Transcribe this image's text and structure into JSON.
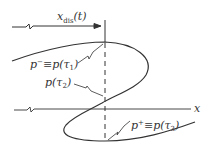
{
  "diagram": {
    "distance_label": {
      "main": "x",
      "sub": "dis",
      "arg": "(t)"
    },
    "axis_label": "x",
    "points": [
      {
        "id": "p_minus",
        "text": "p⁻ ≡ p(τ₁)",
        "main": "p",
        "sup": "−",
        "eq": "≡p(τ",
        "tau_sub": "1",
        "close": ")"
      },
      {
        "id": "p_tau2",
        "text": "p(τ₂)",
        "main": "p(τ",
        "tau_sub": "2",
        "close": ")"
      },
      {
        "id": "p_plus",
        "text": "p⁺ ≡ p(τ₃)",
        "main": "p",
        "sup": "+",
        "eq": "≡p(τ",
        "tau_sub": "3",
        "close": ")"
      }
    ],
    "colors": {
      "line": "#333333",
      "background": "#ffffff"
    }
  }
}
